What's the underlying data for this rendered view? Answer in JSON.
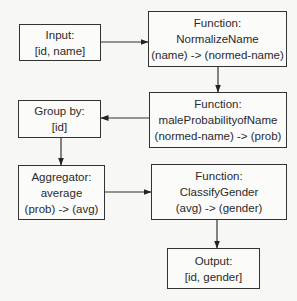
{
  "nodes": {
    "input": {
      "lines": [
        "Input:",
        "[id, name]"
      ]
    },
    "normalize": {
      "lines": [
        "Function:",
        "NormalizeName",
        "(name) -> (normed-name)"
      ]
    },
    "maleprob": {
      "lines": [
        "Function:",
        "maleProbabilityofName",
        "(normed-name) -> (prob)"
      ]
    },
    "groupby": {
      "lines": [
        "Group by:",
        "[id]"
      ]
    },
    "aggregator": {
      "lines": [
        "Aggregator:",
        "average",
        "(prob) -> (avg)"
      ]
    },
    "classify": {
      "lines": [
        "Function:",
        "ClassifyGender",
        "(avg) -> (gender)"
      ]
    },
    "output": {
      "lines": [
        "Output:",
        "[id, gender]"
      ]
    }
  },
  "edges": [
    {
      "from": "input",
      "to": "normalize"
    },
    {
      "from": "normalize",
      "to": "maleprob"
    },
    {
      "from": "maleprob",
      "to": "groupby"
    },
    {
      "from": "groupby",
      "to": "aggregator"
    },
    {
      "from": "aggregator",
      "to": "classify"
    },
    {
      "from": "classify",
      "to": "output"
    }
  ]
}
